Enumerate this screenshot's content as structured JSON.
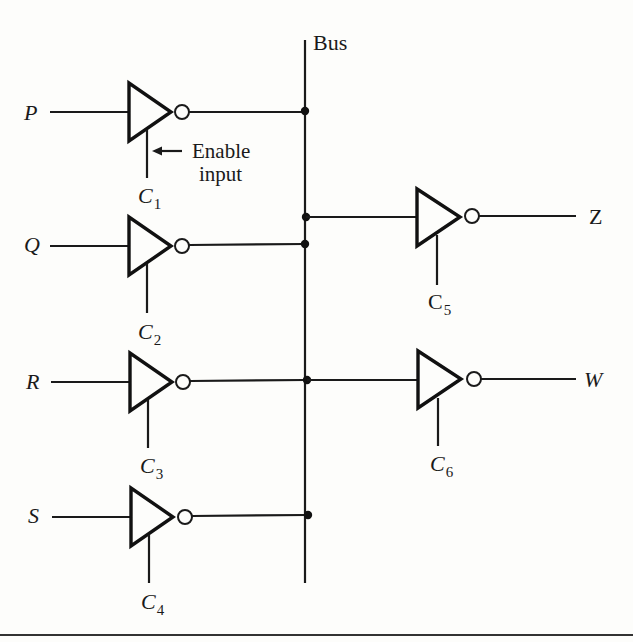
{
  "diagram": {
    "bus": {
      "label": "Bus"
    },
    "inputs": [
      {
        "name": "P",
        "enable": "C",
        "enable_sub": "1"
      },
      {
        "name": "Q",
        "enable": "C",
        "enable_sub": "2"
      },
      {
        "name": "R",
        "enable": "C",
        "enable_sub": "3"
      },
      {
        "name": "S",
        "enable": "C",
        "enable_sub": "4"
      }
    ],
    "outputs": [
      {
        "name": "Z",
        "enable": "C",
        "enable_sub": "5"
      },
      {
        "name": "W",
        "enable": "C",
        "enable_sub": "6"
      }
    ],
    "annotation": {
      "line1": "Enable",
      "line2": "input"
    },
    "colors": {
      "ink": "#1a1a1a",
      "background": "#fdfdfb"
    }
  }
}
